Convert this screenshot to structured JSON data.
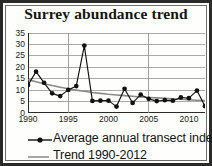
{
  "chart_data": {
    "type": "line",
    "title": "Surrey abundance trend",
    "xlabel": "",
    "ylabel": "",
    "xlim": [
      1990,
      2012
    ],
    "ylim": [
      0,
      35
    ],
    "yticks": [
      0,
      5,
      10,
      15,
      20,
      25,
      30,
      35
    ],
    "xticks": [
      1990,
      1995,
      2000,
      2005,
      2010
    ],
    "grid": "horizontal-and-vertical",
    "legend_position": "below",
    "x": [
      1990,
      1991,
      1992,
      1993,
      1994,
      1995,
      1996,
      1997,
      1998,
      1999,
      2000,
      2001,
      2002,
      2003,
      2004,
      2005,
      2006,
      2007,
      2008,
      2009,
      2010,
      2011,
      2012
    ],
    "series": [
      {
        "name": "Average annual transect index",
        "marker": "filled-circle",
        "color": "#111111",
        "values": [
          12.2,
          18.1,
          13.2,
          8.6,
          7.4,
          10.1,
          11.8,
          29.5,
          5.3,
          5.4,
          5.4,
          2.8,
          10.6,
          4.4,
          8.0,
          6.2,
          5.2,
          5.6,
          5.4,
          6.8,
          6.5,
          9.8,
          3.0
        ]
      },
      {
        "name": "Trend 1990-2012",
        "marker": "none",
        "color": "#8a8a86",
        "values": [
          14.6,
          13.7,
          12.8,
          12.0,
          11.3,
          10.6,
          10.0,
          9.5,
          9.0,
          8.6,
          8.2,
          7.9,
          7.6,
          7.3,
          7.0,
          6.8,
          6.6,
          6.4,
          6.2,
          6.0,
          5.8,
          5.6,
          5.4
        ]
      }
    ]
  },
  "legend": {
    "entries": [
      {
        "label": "Average annual transect index"
      },
      {
        "label": "Trend 1990-2012"
      }
    ]
  }
}
